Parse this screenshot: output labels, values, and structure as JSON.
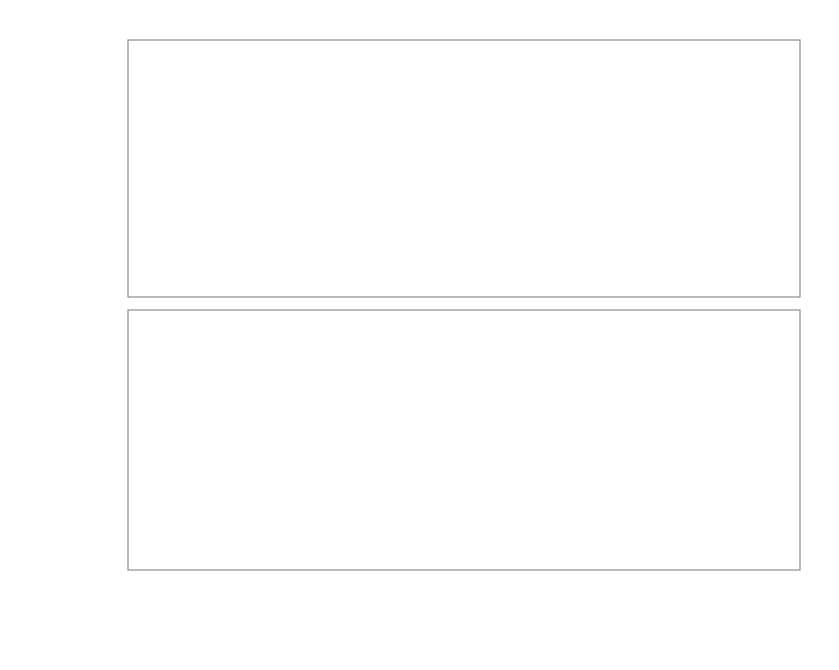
{
  "figure": {
    "width": 839,
    "height": 670,
    "background": "#ffffff"
  },
  "colors": {
    "series_30kev": "#9d9d9d",
    "series_64kev": "#6f6f6f",
    "axis": "#8d8d8d",
    "text": "#6d6d6d",
    "guide": "#bdbdbd"
  },
  "xaxis": {
    "label": "beam rate [ph/s]",
    "offset_text": "1e11",
    "ticks": [
      "0.5",
      "1.0",
      "1.5",
      "2.0",
      "2.5"
    ],
    "tick_values": [
      0.5,
      1.0,
      1.5,
      2.0,
      2.5
    ],
    "range": [
      0.12,
      2.72
    ]
  },
  "legend": {
    "entries": [
      {
        "label": "ε= 30 keV",
        "color": "#9d9d9d"
      },
      {
        "label": "ε= 64 keV",
        "color": "#6f6f6f"
      }
    ]
  },
  "guides": {
    "label": "vertical reference lines",
    "x_values": [
      0.93,
      1.62
    ]
  },
  "chart_data": [
    {
      "type": "scatter",
      "panel": "top",
      "title": "",
      "xlabel": "beam rate [ph/s]",
      "ylabel": "counting efficiency (%)",
      "xlim": [
        0.12,
        2.72
      ],
      "ylim": [
        77.4,
        92.5
      ],
      "yticks": [
        80,
        85,
        90
      ],
      "ytick_labels": [
        "80",
        "85",
        "90"
      ],
      "grid": false,
      "legend_position": "upper right",
      "x_offset_factor": "1e11",
      "series": [
        {
          "name": "ε= 30 keV",
          "color": "#9d9d9d",
          "x": [
            0.31,
            0.38,
            0.44,
            0.52,
            0.62,
            0.72,
            0.81,
            0.93,
            1.06,
            1.25,
            1.46,
            1.62,
            1.84,
            2.17,
            2.6
          ],
          "y": [
            91.5,
            90.5,
            89.6,
            88.6,
            88.0,
            87.2,
            86.7,
            86.1,
            85.0,
            84.0,
            83.3,
            82.2,
            81.6,
            80.4,
            78.6
          ],
          "yerr": [
            0.25,
            0.25,
            0.25,
            0.25,
            0.25,
            0.25,
            0.25,
            0.25,
            0.25,
            0.25,
            0.25,
            0.25,
            0.25,
            0.25,
            0.25
          ],
          "fit": {
            "style": "dashed",
            "x": [
              0.3,
              0.5,
              0.75,
              1.0,
              1.3,
              1.7,
              2.1,
              2.62
            ],
            "y": [
              91.6,
              88.9,
              86.9,
              85.6,
              84.2,
              82.4,
              80.8,
              78.6
            ]
          }
        },
        {
          "name": "ε= 64 keV",
          "color": "#6f6f6f",
          "x": [
            0.18,
            0.25,
            0.3,
            0.37,
            0.42,
            0.46,
            0.52,
            0.58,
            0.65,
            0.73,
            0.82,
            0.93,
            1.06,
            1.25,
            1.48
          ],
          "y": [
            90.7,
            89.6,
            89.2,
            88.2,
            87.4,
            86.9,
            86.2,
            85.0,
            84.3,
            83.4,
            82.9,
            82.8,
            82.4,
            81.2,
            78.9
          ],
          "yerr": [
            0.25,
            0.25,
            0.25,
            0.25,
            0.25,
            0.25,
            0.25,
            0.3,
            0.25,
            0.3,
            0.3,
            0.3,
            0.35,
            0.4,
            0.5
          ],
          "fit": {
            "style": "dashed",
            "x": [
              0.17,
              0.3,
              0.45,
              0.6,
              0.78,
              1.0,
              1.22,
              1.5
            ],
            "y": [
              90.8,
              89.2,
              87.4,
              85.8,
              84.2,
              82.8,
              81.4,
              79.0
            ]
          }
        }
      ]
    },
    {
      "type": "scatter",
      "panel": "bottom",
      "title": "",
      "xlabel": "beam rate [ph/s]",
      "ylabel": "time to reach dose-limited resolution [h]",
      "xlim": [
        0.12,
        2.72
      ],
      "ylim": [
        0,
        50
      ],
      "yticks": [
        0,
        10,
        20,
        30,
        40,
        50
      ],
      "ytick_labels": [
        "0",
        "10",
        "20",
        "30",
        "40",
        "50"
      ],
      "grid": false,
      "x_offset_factor": "1e11",
      "series": [
        {
          "name": "ε= 64 keV",
          "color": "#6f6f6f",
          "x": [
            0.31,
            0.37,
            0.41,
            0.46,
            0.52,
            0.58,
            0.65,
            0.73,
            0.82,
            0.93,
            1.06,
            1.25,
            1.48
          ],
          "y": [
            38.6,
            44.8,
            40.3,
            36.0,
            31.8,
            28.3,
            25.6,
            25.5,
            24.8,
            24.4,
            25.1,
            28.0,
            44.8
          ]
        },
        {
          "name": "ε= 30 keV",
          "color": "#9d9d9d",
          "x": [
            0.41,
            0.52,
            0.62,
            0.71,
            0.8,
            0.93,
            1.06,
            1.3,
            1.44,
            1.62,
            1.84,
            2.17,
            2.6
          ],
          "y": [
            24.2,
            19.4,
            15.3,
            13.7,
            12.3,
            10.9,
            9.8,
            8.9,
            8.6,
            8.5,
            8.6,
            10.1,
            16.0
          ]
        }
      ]
    }
  ]
}
